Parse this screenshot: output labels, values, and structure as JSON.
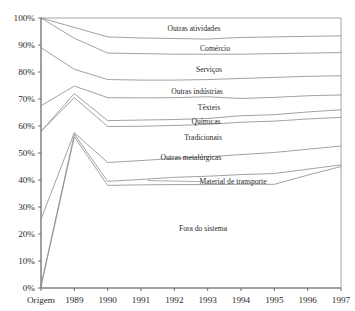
{
  "chart_data": {
    "type": "area",
    "title": "",
    "subtitle": "",
    "xlabel": "",
    "ylabel": "",
    "ylim": [
      0,
      100
    ],
    "grid": false,
    "legend_position": "inline-band-labels",
    "stacked": true,
    "categories": [
      "Origem",
      "1989",
      "1990",
      "1991",
      "1992",
      "1993",
      "1994",
      "1995",
      "1996",
      "1997"
    ],
    "x": [
      "Origem",
      "1989",
      "1990",
      "1991",
      "1992",
      "1993",
      "1994",
      "1995",
      "1996",
      "1997"
    ],
    "ytick_labels": [
      "0%",
      "10%",
      "20%",
      "30%",
      "40%",
      "50%",
      "60%",
      "70%",
      "80%",
      "90%",
      "100%"
    ],
    "ytick_values": [
      0,
      10,
      20,
      30,
      40,
      50,
      60,
      70,
      80,
      90,
      100
    ],
    "xtick_labels": [
      "Origem",
      "1989",
      "1990",
      "1991",
      "1992",
      "1993",
      "1994",
      "1995",
      "1996",
      "1997"
    ],
    "series": [
      {
        "name": "Outras atividades",
        "cumulative_top": [
          100,
          100,
          100,
          100,
          100,
          100,
          100,
          100,
          100,
          100
        ],
        "cumulative_bottom": [
          100,
          96.5,
          93.0,
          92.6,
          92.4,
          92.2,
          92.8,
          93.0,
          93.2,
          93.4
        ],
        "values": [
          0,
          3.5,
          7.0,
          7.4,
          7.6,
          7.8,
          7.2,
          7.0,
          6.8,
          6.6
        ]
      },
      {
        "name": "Comércio",
        "cumulative_top": [
          100,
          96.5,
          93.0,
          92.6,
          92.4,
          92.2,
          92.8,
          93.0,
          93.2,
          93.4
        ],
        "cumulative_bottom": [
          100,
          92.5,
          87.0,
          86.8,
          86.6,
          86.6,
          86.6,
          86.8,
          87.0,
          87.2
        ],
        "values": [
          0,
          4.0,
          6.0,
          5.8,
          5.8,
          5.6,
          6.2,
          6.2,
          6.2,
          6.2
        ]
      },
      {
        "name": "Serviços",
        "cumulative_top": [
          100,
          92.5,
          87.0,
          86.8,
          86.6,
          86.6,
          86.6,
          86.8,
          87.0,
          87.2
        ],
        "cumulative_bottom": [
          89.0,
          81.0,
          77.2,
          77.0,
          77.0,
          77.2,
          77.6,
          78.0,
          78.4,
          78.6
        ],
        "values": [
          11.0,
          11.5,
          9.8,
          9.8,
          9.6,
          9.4,
          9.0,
          8.8,
          8.6,
          8.6
        ]
      },
      {
        "name": "Outras indústrias",
        "cumulative_top": [
          89.0,
          81.0,
          77.2,
          77.0,
          77.0,
          77.2,
          77.6,
          78.0,
          78.4,
          78.6
        ],
        "cumulative_bottom": [
          67.5,
          74.8,
          70.5,
          70.4,
          70.5,
          70.8,
          70.2,
          70.6,
          71.2,
          71.5
        ],
        "values": [
          21.5,
          6.2,
          6.7,
          6.6,
          6.5,
          6.4,
          7.4,
          7.4,
          7.2,
          7.1
        ]
      },
      {
        "name": "Têxteis",
        "cumulative_top": [
          67.5,
          74.8,
          70.5,
          70.4,
          70.5,
          70.8,
          70.2,
          70.6,
          71.2,
          71.5
        ],
        "cumulative_bottom": [
          58.0,
          72.0,
          62.0,
          62.2,
          62.4,
          62.8,
          63.8,
          64.2,
          65.2,
          66.0
        ],
        "values": [
          9.5,
          2.8,
          8.5,
          8.2,
          8.1,
          8.0,
          6.4,
          6.4,
          6.0,
          5.5
        ]
      },
      {
        "name": "Químicas",
        "cumulative_top": [
          58.0,
          72.0,
          62.0,
          62.2,
          62.4,
          62.8,
          63.8,
          64.2,
          65.2,
          66.0
        ],
        "cumulative_bottom": [
          58.0,
          70.5,
          59.8,
          59.9,
          60.2,
          60.6,
          61.4,
          61.8,
          62.6,
          63.2
        ],
        "values": [
          0,
          1.5,
          2.2,
          2.3,
          2.2,
          2.2,
          2.4,
          2.4,
          2.6,
          2.8
        ]
      },
      {
        "name": "Tradicionais",
        "cumulative_top": [
          58.0,
          70.5,
          59.8,
          59.9,
          60.2,
          60.6,
          61.4,
          61.8,
          62.6,
          63.2
        ],
        "cumulative_bottom": [
          25.5,
          57.5,
          46.5,
          47.2,
          48.0,
          48.6,
          49.4,
          50.2,
          51.4,
          52.6
        ],
        "values": [
          32.5,
          13.0,
          13.3,
          12.7,
          12.2,
          12.0,
          12.0,
          11.6,
          11.2,
          10.6
        ]
      },
      {
        "name": "Outras metalúrgicas",
        "cumulative_top": [
          25.5,
          57.5,
          46.5,
          47.2,
          48.0,
          48.6,
          49.4,
          50.2,
          51.4,
          52.6
        ],
        "cumulative_bottom": [
          1.0,
          57.0,
          39.5,
          40.2,
          41.0,
          41.4,
          42.0,
          42.4,
          44.0,
          45.6
        ],
        "values": [
          24.5,
          0.5,
          7.0,
          7.0,
          7.0,
          7.2,
          7.4,
          7.8,
          7.4,
          7.0
        ]
      },
      {
        "name": "Material de transporte",
        "cumulative_top": [
          1.0,
          57.0,
          39.5,
          40.2,
          41.0,
          41.4,
          42.0,
          42.4,
          44.0,
          45.6
        ],
        "cumulative_bottom": [
          0.5,
          56.0,
          38.0,
          38.2,
          38.3,
          38.3,
          38.4,
          38.4,
          41.8,
          45.0
        ],
        "values": [
          0.5,
          1.0,
          1.5,
          2.0,
          2.7,
          3.1,
          3.6,
          4.0,
          2.2,
          0.6
        ]
      },
      {
        "name": "Fora do sistema",
        "cumulative_top": [
          0.5,
          56.0,
          38.0,
          38.2,
          38.3,
          38.3,
          38.4,
          38.4,
          41.8,
          45.0
        ],
        "cumulative_bottom": [
          0,
          0,
          0,
          0,
          0,
          0,
          0,
          0,
          0,
          0
        ],
        "values": [
          0.5,
          56.0,
          38.0,
          38.2,
          38.3,
          38.3,
          38.4,
          38.4,
          41.8,
          45.0
        ]
      }
    ],
    "band_labels": [
      {
        "text": "Outras atividades",
        "x_pct": 51,
        "y_pct": 96.3
      },
      {
        "text": "Comércio",
        "x_pct": 58,
        "y_pct": 88.6
      },
      {
        "text": "Serviços",
        "x_pct": 56,
        "y_pct": 80.9
      },
      {
        "text": "Outras indústrias",
        "x_pct": 52,
        "y_pct": 73.0
      },
      {
        "text": "Têxteis",
        "x_pct": 56,
        "y_pct": 67.0
      },
      {
        "text": "Químicas",
        "x_pct": 55,
        "y_pct": 61.6
      },
      {
        "text": "Tradicionais",
        "x_pct": 54,
        "y_pct": 55.6
      },
      {
        "text": "Outras metalúrgicas",
        "x_pct": 50,
        "y_pct": 48.5
      },
      {
        "text": "Material de transporte",
        "x_pct": 64,
        "y_pct": 39.4
      },
      {
        "text": "Fora do sistema",
        "x_pct": 54,
        "y_pct": 22.0
      }
    ],
    "leader_line": {
      "name": "material-de-transporte-leader",
      "from_x_pct": 35.5,
      "from_y_pct": 39.8,
      "to_x_pct": 53.5,
      "to_y_pct": 39.4
    },
    "colors": {
      "line": "#8a8a8a",
      "axis": "#6e6e6e",
      "text": "#1f1f1f",
      "background": "#ffffff"
    }
  }
}
